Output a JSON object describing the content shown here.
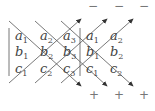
{
  "matrix": {
    "rows": [
      [
        {
          "v": "a",
          "s": "1"
        },
        {
          "v": "a",
          "s": "2"
        },
        {
          "v": "a",
          "s": "3"
        },
        {
          "v": "a",
          "s": "1"
        },
        {
          "v": "a",
          "s": "2"
        }
      ],
      [
        {
          "v": "b",
          "s": "1"
        },
        {
          "v": "b",
          "s": "2"
        },
        {
          "v": "b",
          "s": "3"
        },
        {
          "v": "b",
          "s": "1"
        },
        {
          "v": "b",
          "s": "2"
        }
      ],
      [
        {
          "v": "c",
          "s": "1"
        },
        {
          "v": "c",
          "s": "2"
        },
        {
          "v": "c",
          "s": "3"
        },
        {
          "v": "c",
          "s": "1"
        },
        {
          "v": "c",
          "s": "2"
        }
      ]
    ]
  },
  "signs": {
    "top": [
      "−",
      "−",
      "−"
    ],
    "bottom": [
      "+",
      "+",
      "+"
    ]
  },
  "colors": {
    "line": "#555555",
    "text": "#444444",
    "sign": "#777777"
  }
}
